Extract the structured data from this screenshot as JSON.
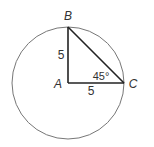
{
  "diagram": {
    "points": {
      "A": {
        "label": "A"
      },
      "B": {
        "label": "B"
      },
      "C": {
        "label": "C"
      }
    },
    "sides": {
      "AB": {
        "label": "5"
      },
      "AC": {
        "label": "5"
      }
    },
    "angle_C": {
      "label": "45°"
    },
    "colors": {
      "circle": "#777777",
      "triangle": "#222222",
      "text": "#333333"
    }
  }
}
